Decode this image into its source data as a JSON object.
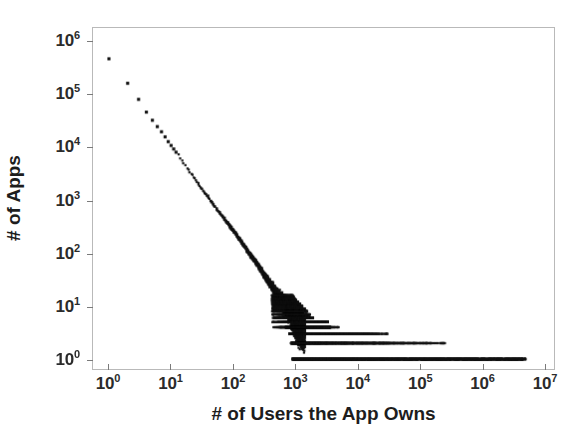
{
  "chart_data": {
    "type": "scatter",
    "title": "",
    "subtitle": "",
    "xlabel": "# of Users the App Owns",
    "ylabel": "# of Apps",
    "xscale": "log",
    "yscale": "log",
    "xlim": [
      1,
      10000000
    ],
    "ylim": [
      1,
      1000000
    ],
    "grid": false,
    "legend": null,
    "annotations": [],
    "marker": {
      "shape": "square",
      "color": "#111111",
      "size_px": 2.2
    },
    "xticks": [
      {
        "value": 1,
        "mantissa": "10",
        "exponent": "0"
      },
      {
        "value": 10,
        "mantissa": "10",
        "exponent": "1"
      },
      {
        "value": 100,
        "mantissa": "10",
        "exponent": "2"
      },
      {
        "value": 1000,
        "mantissa": "10",
        "exponent": "3"
      },
      {
        "value": 10000,
        "mantissa": "10",
        "exponent": "4"
      },
      {
        "value": 100000,
        "mantissa": "10",
        "exponent": "5"
      },
      {
        "value": 1000000,
        "mantissa": "10",
        "exponent": "6"
      },
      {
        "value": 10000000,
        "mantissa": "10",
        "exponent": "7"
      }
    ],
    "yticks": [
      {
        "value": 1,
        "mantissa": "10",
        "exponent": "0"
      },
      {
        "value": 10,
        "mantissa": "10",
        "exponent": "1"
      },
      {
        "value": 100,
        "mantissa": "10",
        "exponent": "2"
      },
      {
        "value": 1000,
        "mantissa": "10",
        "exponent": "3"
      },
      {
        "value": 10000,
        "mantissa": "10",
        "exponent": "4"
      },
      {
        "value": 100000,
        "mantissa": "10",
        "exponent": "5"
      },
      {
        "value": 1000000,
        "mantissa": "10",
        "exponent": "6"
      }
    ],
    "points": [
      [
        1,
        480000
      ],
      [
        2,
        165000
      ],
      [
        3,
        82000
      ],
      [
        4,
        47000
      ],
      [
        5,
        33000
      ],
      [
        6,
        25000
      ],
      [
        7,
        20000
      ],
      [
        8,
        16000
      ],
      [
        9,
        13000
      ],
      [
        10,
        11000
      ],
      [
        12,
        8200
      ],
      [
        14,
        6400
      ],
      [
        16,
        5100
      ],
      [
        18,
        4200
      ],
      [
        20,
        3500
      ],
      [
        25,
        2400
      ],
      [
        30,
        1800
      ],
      [
        35,
        1400
      ],
      [
        40,
        1150
      ],
      [
        50,
        800
      ],
      [
        60,
        600
      ],
      [
        70,
        470
      ],
      [
        80,
        380
      ],
      [
        90,
        320
      ],
      [
        100,
        270
      ],
      [
        120,
        200
      ],
      [
        150,
        140
      ],
      [
        180,
        100
      ],
      [
        200,
        85
      ],
      [
        250,
        60
      ],
      [
        300,
        42
      ],
      [
        400,
        26
      ],
      [
        500,
        18
      ],
      [
        600,
        13
      ],
      [
        700,
        10
      ],
      [
        800,
        8
      ],
      [
        900,
        6
      ],
      [
        1000,
        5
      ],
      [
        1200,
        4
      ],
      [
        1500,
        3
      ],
      [
        2000,
        2
      ],
      [
        3000,
        2
      ],
      [
        5000,
        1
      ],
      [
        10000,
        1
      ],
      [
        100000,
        1
      ],
      [
        1000000,
        1
      ],
      [
        5000000,
        1
      ]
    ],
    "bands": [
      {
        "count": 1,
        "x_start": 900,
        "x_end": 5000000
      },
      {
        "count": 2,
        "x_start": 850,
        "x_end": 300000
      },
      {
        "count": 3,
        "x_start": 800,
        "x_end": 30000
      },
      {
        "count": 4,
        "x_start": 700,
        "x_end": 5000
      }
    ]
  }
}
